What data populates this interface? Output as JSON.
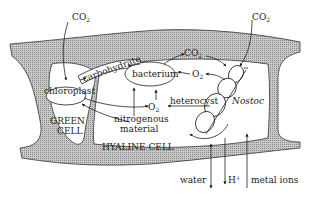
{
  "diagram": {
    "type": "biological-process-diagram",
    "colors": {
      "background": "#ffffff",
      "cell_wall_fill": "#b5b5b5",
      "line": "#222222"
    },
    "labels": {
      "co2_top_left": "CO",
      "co2_top_left_sub": "2",
      "co2_top_right": "CO",
      "co2_top_right_sub": "2",
      "co2_mid": "CO",
      "co2_mid_sub": "2",
      "o2_upper": "O",
      "o2_upper_sub": "2",
      "o2_lower": "O",
      "o2_lower_sub": "2",
      "carbohydrate": "carbohydrate",
      "bacterium": "bacterium",
      "chloroplast": "chloroplast",
      "heterocyst": "heterocyst",
      "nostoc": "Nostoc",
      "nitrogenous_line1": "nitrogenous",
      "nitrogenous_line2": "material",
      "green_cell_line1": "GREEN",
      "green_cell_line2": "CELL",
      "hyaline_cell": "HYALINE CELL",
      "water": "water",
      "h_plus": "H",
      "h_plus_sup": "+",
      "metal_ions": "metal ions"
    },
    "flows": [
      {
        "from": "atmosphere",
        "to": "chloroplast",
        "label": "CO2"
      },
      {
        "from": "atmosphere",
        "to": "Nostoc",
        "label": "CO2"
      },
      {
        "from": "chloroplast",
        "to": "bacterium",
        "label": "carbohydrate"
      },
      {
        "from": "bacterium",
        "to": "Nostoc",
        "label": "CO2"
      },
      {
        "from": "Nostoc",
        "to": "bacterium",
        "label": "O2"
      },
      {
        "from": "chloroplast",
        "to": "O2 (lower)",
        "label": "O2"
      },
      {
        "from": "heterocyst",
        "to": "O2 (lower)",
        "label": "O2"
      },
      {
        "from": "O2 (lower)",
        "to": "bacterium",
        "label": "O2"
      },
      {
        "from": "heterocyst",
        "to": "green cell",
        "label": "nitrogenous material"
      },
      {
        "from": "outside",
        "to": "hyaline cell",
        "label": "water (bidirectional)"
      },
      {
        "from": "hyaline cell",
        "to": "outside",
        "label": "H+"
      },
      {
        "from": "outside",
        "to": "hyaline cell",
        "label": "metal ions"
      }
    ]
  }
}
